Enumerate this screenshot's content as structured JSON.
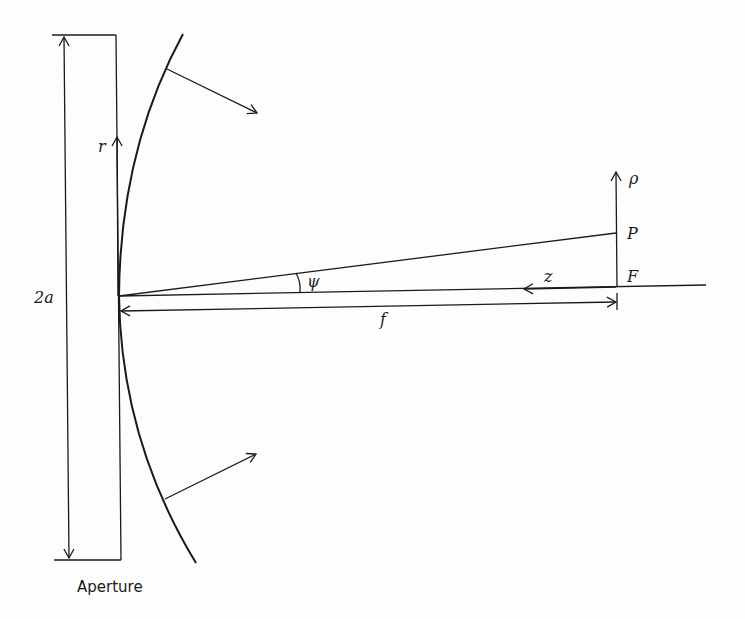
{
  "diagram": {
    "labels": {
      "aperture": "Aperture",
      "diameter": "2a",
      "radial_coord": "r",
      "angle": "ψ",
      "axial_coord": "z",
      "focal_length": "f",
      "focal_point": "F",
      "observation_point": "P",
      "focal_plane_coord": "ρ"
    },
    "elements": [
      {
        "id": "aperture-plane",
        "type": "rectangle-outline",
        "description": "Aperture plane"
      },
      {
        "id": "diameter-dimension",
        "type": "double-arrow",
        "label": "2a"
      },
      {
        "id": "r-axis",
        "type": "arrow",
        "label": "r"
      },
      {
        "id": "reflector-curve",
        "type": "curve",
        "description": "Reflector surface"
      },
      {
        "id": "normal-arrow-upper",
        "type": "arrow"
      },
      {
        "id": "normal-arrow-lower",
        "type": "arrow"
      },
      {
        "id": "optical-axis",
        "type": "line"
      },
      {
        "id": "ray-to-P",
        "type": "line"
      },
      {
        "id": "angle-arc",
        "type": "arc",
        "label": "ψ"
      },
      {
        "id": "z-arrow",
        "type": "arrow",
        "label": "z"
      },
      {
        "id": "f-dimension",
        "type": "double-arrow",
        "label": "f"
      },
      {
        "id": "rho-axis",
        "type": "arrow",
        "label": "ρ"
      }
    ]
  }
}
